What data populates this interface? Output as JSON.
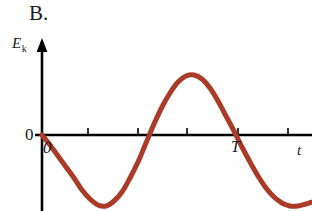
{
  "figure": {
    "panel_label": "B.",
    "y_axis_label": "E",
    "y_axis_subscript": "k",
    "x_axis_label": "t",
    "origin_label_left": "0",
    "origin_label_below": "0",
    "period_label": "T"
  },
  "colors": {
    "curve": "#a93b28",
    "axis": "#000000",
    "text": "#1a1a1a",
    "background": "#ffffff"
  },
  "chart_data": {
    "type": "line",
    "title": "B.",
    "xlabel": "t",
    "ylabel": "E_k",
    "grid": false,
    "legend": null,
    "axes": {
      "x_axis_pixel_y": 135,
      "y_axis_pixel_x": 42,
      "x_origin_pixel": 42,
      "x_end_pixel": 312,
      "y_arrow_top_pixel": 40
    },
    "x_tick_labels": [
      "0",
      "",
      "",
      "",
      "T",
      ""
    ],
    "x_ticks_pixel": [
      42,
      88,
      138,
      187,
      238,
      288
    ],
    "period_pixel_x": 238,
    "amplitude_pixel": 60,
    "zero_crossings_pixel_x": [
      42,
      138,
      238
    ],
    "extrema": [
      {
        "kind": "minimum",
        "x_pixel": 90,
        "y_pixel": 205
      },
      {
        "kind": "maximum",
        "x_pixel": 188,
        "y_pixel": 75
      },
      {
        "kind": "minimum",
        "x_pixel": 300,
        "y_pixel": 205
      }
    ],
    "curve_points": [
      [
        42,
        135
      ],
      [
        50,
        145
      ],
      [
        58,
        156
      ],
      [
        66,
        167
      ],
      [
        74,
        178
      ],
      [
        82,
        190
      ],
      [
        90,
        199
      ],
      [
        98,
        205
      ],
      [
        106,
        206
      ],
      [
        114,
        201
      ],
      [
        122,
        192
      ],
      [
        130,
        178
      ],
      [
        138,
        162
      ],
      [
        146,
        143
      ],
      [
        154,
        124
      ],
      [
        162,
        107
      ],
      [
        170,
        93
      ],
      [
        178,
        82
      ],
      [
        186,
        76
      ],
      [
        194,
        75
      ],
      [
        202,
        79
      ],
      [
        210,
        88
      ],
      [
        218,
        101
      ],
      [
        226,
        116
      ],
      [
        234,
        131
      ],
      [
        242,
        147
      ],
      [
        250,
        162
      ],
      [
        258,
        176
      ],
      [
        266,
        188
      ],
      [
        274,
        197
      ],
      [
        282,
        203
      ],
      [
        290,
        206
      ],
      [
        298,
        206
      ],
      [
        306,
        204
      ],
      [
        312,
        202
      ]
    ],
    "ylim_pixel": [
      40,
      211
    ],
    "xlim_pixel": [
      42,
      312
    ]
  }
}
